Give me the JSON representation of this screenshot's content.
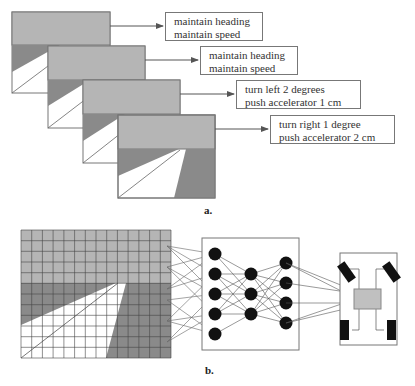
{
  "part_a": {
    "caption": "a.",
    "frames": [
      {
        "action_line1": "maintain heading",
        "action_line2": "maintain speed"
      },
      {
        "action_line1": "maintain heading",
        "action_line2": "maintain speed"
      },
      {
        "action_line1": "turn left 2 degrees",
        "action_line2": "push accelerator 1 cm"
      },
      {
        "action_line1": "turn right 1 degree",
        "action_line2": "push accelerator 2 cm"
      }
    ]
  },
  "part_b": {
    "caption": "b.",
    "grid": {
      "cols": 14,
      "rows": 12
    },
    "network": {
      "layers": [
        5,
        3,
        4
      ]
    },
    "colors": {
      "sky": "#b5b5b5",
      "ground": "#8a8a8a",
      "road": "#ffffff",
      "node": "#111111",
      "controller": "#c0c0c0"
    }
  }
}
